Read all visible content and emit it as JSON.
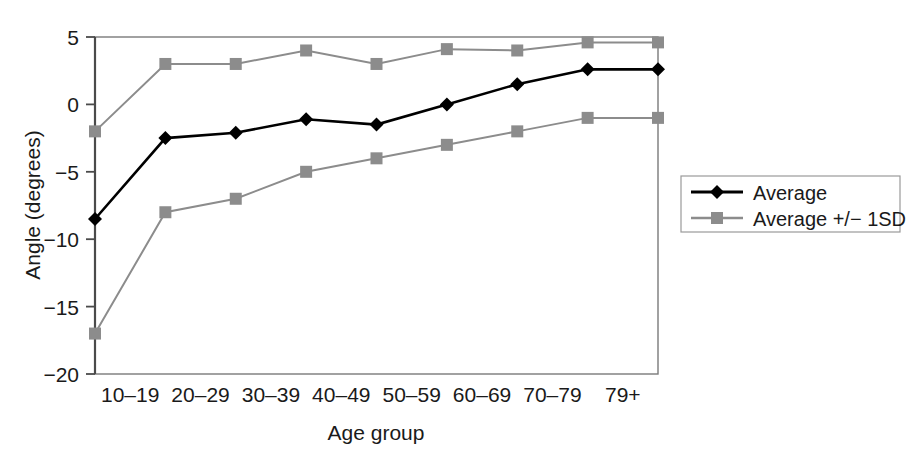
{
  "chart_data": {
    "type": "line",
    "title": "",
    "xlabel": "Age group",
    "ylabel": "Angle (degrees)",
    "categories": [
      "10–19",
      "20–29",
      "30–39",
      "40–49",
      "50–59",
      "60–69",
      "70–79",
      "79+"
    ],
    "x_tick_labels": [
      "10–19",
      "20–29",
      "30–39",
      "40–49",
      "50–59",
      "60–69",
      "70–79",
      "79+"
    ],
    "y_tick_labels": [
      "5",
      "0",
      "−5",
      "−10",
      "−15",
      "−20"
    ],
    "y_ticks": [
      5,
      0,
      -5,
      -10,
      -15,
      -20
    ],
    "ylim": [
      -20,
      5
    ],
    "grid": false,
    "legend_position": "right",
    "series": [
      {
        "name": "Average",
        "color": "#000000",
        "marker": "diamond",
        "values": [
          -8.5,
          -2.5,
          -2.1,
          -1.1,
          -1.5,
          0.0,
          1.5,
          2.6
        ]
      },
      {
        "name": "Average +/− 1SD",
        "color": "#8c8c8c",
        "marker": "square",
        "values": [
          -2.0,
          3.0,
          3.0,
          4.0,
          3.0,
          4.1,
          4.0,
          4.6
        ]
      },
      {
        "name": "Average − 1SD",
        "color": "#8c8c8c",
        "marker": "square",
        "values": [
          -17.0,
          -8.0,
          -7.0,
          -5.0,
          -4.0,
          -3.0,
          -2.0,
          -1.0
        ]
      }
    ]
  },
  "legend": {
    "entries": [
      {
        "label": "Average",
        "color": "#000000",
        "marker": "diamond"
      },
      {
        "label": "Average +/− 1SD",
        "color": "#8c8c8c",
        "marker": "square"
      }
    ]
  },
  "axes": {
    "y_title": "Angle (degrees)",
    "x_title": "Age group",
    "y_labels": [
      "5",
      "0",
      "−5",
      "−10",
      "−15",
      "−20"
    ],
    "x_labels": [
      "10–19",
      "20–29",
      "30–39",
      "40–49",
      "50–59",
      "60–69",
      "70–79",
      "79+"
    ]
  }
}
